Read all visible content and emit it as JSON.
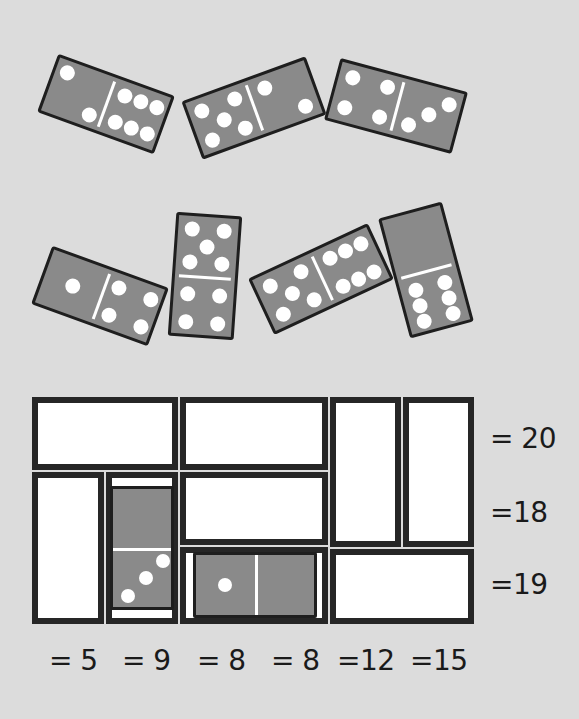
{
  "puzzle": {
    "type": "domino-grid-sum-puzzle",
    "colors": {
      "background": "#dcdcdc",
      "domino_face": "#8a8a8a",
      "domino_border": "#1e1e1e",
      "pip": "#ffffff",
      "cell_fill": "#ffffff",
      "cell_border": "#262626"
    },
    "loose_dominoes": [
      {
        "id": "d1",
        "ends": [
          2,
          6
        ],
        "angle_deg": 20
      },
      {
        "id": "d2",
        "ends": [
          5,
          2
        ],
        "angle_deg": -20
      },
      {
        "id": "d3",
        "ends": [
          4,
          3
        ],
        "angle_deg": 15
      },
      {
        "id": "d4",
        "ends": [
          1,
          4
        ],
        "angle_deg": 20
      },
      {
        "id": "d5",
        "ends": [
          5,
          4
        ],
        "angle_deg": 4,
        "orientation": "vertical"
      },
      {
        "id": "d6",
        "ends": [
          5,
          6
        ],
        "angle_deg": -25
      },
      {
        "id": "d7",
        "ends": [
          0,
          6
        ],
        "angle_deg": -15,
        "orientation": "vertical"
      }
    ],
    "grid": {
      "rows": 3,
      "cols": 6,
      "cells": [
        {
          "id": "c1",
          "orientation": "horizontal",
          "row": 1,
          "cols": [
            1,
            2
          ],
          "filled": null
        },
        {
          "id": "c2",
          "orientation": "horizontal",
          "row": 1,
          "cols": [
            3,
            4
          ],
          "filled": null
        },
        {
          "id": "c3",
          "orientation": "vertical",
          "rows": [
            1,
            2
          ],
          "col": 5,
          "filled": null
        },
        {
          "id": "c4",
          "orientation": "vertical",
          "rows": [
            1,
            2
          ],
          "col": 6,
          "filled": null
        },
        {
          "id": "c5",
          "orientation": "vertical",
          "rows": [
            2,
            3
          ],
          "col": 1,
          "filled": null
        },
        {
          "id": "c6",
          "orientation": "vertical",
          "rows": [
            2,
            3
          ],
          "col": 2,
          "filled": [
            0,
            3
          ]
        },
        {
          "id": "c7",
          "orientation": "horizontal",
          "row": 2,
          "cols": [
            3,
            4
          ],
          "filled": null
        },
        {
          "id": "c8",
          "orientation": "horizontal",
          "row": 3,
          "cols": [
            3,
            4
          ],
          "filled": [
            1,
            0
          ]
        },
        {
          "id": "c9",
          "orientation": "horizontal",
          "row": 3,
          "cols": [
            5,
            6
          ],
          "filled": null
        }
      ]
    },
    "row_sums": [
      "= 20",
      "=18",
      "=19"
    ],
    "col_sums": [
      "= 5",
      "= 9",
      "= 8",
      "= 8",
      "=12",
      "=15"
    ]
  }
}
